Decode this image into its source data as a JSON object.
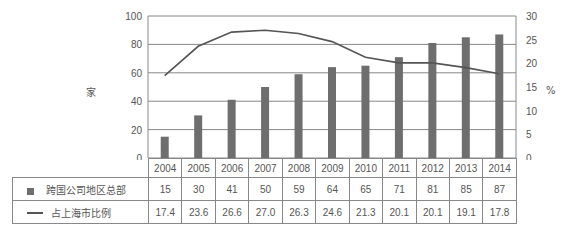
{
  "chart_data": {
    "type": "bar",
    "combo": "bar+line",
    "title": "",
    "categories": [
      "2004",
      "2005",
      "2006",
      "2007",
      "2008",
      "2009",
      "2010",
      "2011",
      "2012",
      "2013",
      "2014"
    ],
    "series": [
      {
        "name": "跨国公司地区总部",
        "type": "bar",
        "axis": "left",
        "values": [
          15,
          30,
          41,
          50,
          59,
          64,
          65,
          71,
          81,
          85,
          87
        ]
      },
      {
        "name": "占上海市比例",
        "type": "line",
        "axis": "right",
        "values": [
          17.4,
          23.6,
          26.6,
          27.0,
          26.3,
          24.6,
          21.3,
          20.1,
          20.1,
          19.1,
          17.8
        ]
      }
    ],
    "ylabel": "家",
    "y2label": "%",
    "ylim": [
      0,
      100
    ],
    "y2lim": [
      0,
      30
    ],
    "yticks": [
      0,
      20,
      40,
      60,
      80,
      100
    ],
    "y2ticks": [
      0,
      5,
      10,
      15,
      20,
      25,
      30
    ],
    "grid": true,
    "legend_position": "data-table-below",
    "colors": {
      "bar": "#6e6e6e",
      "line": "#555555",
      "grid": "#888888"
    }
  },
  "labels": {
    "left_unit": "家",
    "right_unit": "%",
    "bar_series_name": "跨国公司地区总部",
    "line_series_name": "占上海市比例"
  }
}
